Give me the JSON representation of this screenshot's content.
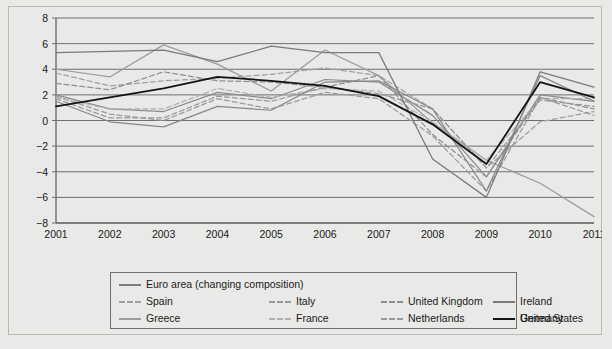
{
  "chart_data": {
    "type": "line",
    "title": "",
    "subtitle": "",
    "xlabel": "",
    "ylabel": "",
    "x": [
      2001,
      2002,
      2003,
      2004,
      2005,
      2006,
      2007,
      2008,
      2009,
      2010,
      2011
    ],
    "xticklabels": [
      "2001",
      "2002",
      "2003",
      "2004",
      "2005",
      "2006",
      "2007",
      "2008",
      "2009",
      "2010",
      "2011"
    ],
    "yticklabels": [
      "8",
      "6",
      "4",
      "2",
      "0",
      "-2",
      "-4",
      "-6",
      "-8"
    ],
    "ylim": [
      -8,
      8
    ],
    "ytick_step": 2,
    "xlim": [
      2001,
      2011
    ],
    "grid": "horizontal",
    "legend_position": "bottom",
    "series": [
      {
        "name": "Euro area (changing composition)",
        "style": "solid",
        "color": "#8a8a8a",
        "values": [
          2.0,
          0.9,
          0.7,
          2.2,
          1.7,
          3.2,
          3.0,
          0.4,
          -4.4,
          2.0,
          1.5
        ]
      },
      {
        "name": "Spain",
        "style": "dashed",
        "color": "#a0a0a0",
        "values": [
          3.7,
          2.7,
          3.1,
          3.3,
          3.6,
          4.1,
          3.5,
          0.9,
          -3.7,
          -0.1,
          0.7
        ]
      },
      {
        "name": "Greece",
        "style": "solid",
        "color": "#9c9c9c",
        "values": [
          4.0,
          3.4,
          5.9,
          4.4,
          2.3,
          5.5,
          3.5,
          -0.2,
          -3.1,
          -4.9,
          -7.5
        ]
      },
      {
        "name": "Italy",
        "style": "dashed",
        "color": "#9a9a9a",
        "values": [
          1.9,
          0.5,
          0.0,
          1.7,
          0.9,
          2.2,
          1.7,
          -1.2,
          -5.5,
          1.8,
          0.4
        ]
      },
      {
        "name": "France",
        "style": "dashed",
        "color": "#b0b0b0",
        "values": [
          1.8,
          0.9,
          0.9,
          2.5,
          1.8,
          2.5,
          2.3,
          -0.1,
          -3.1,
          1.7,
          1.7
        ]
      },
      {
        "name": "United Kingdom",
        "style": "dashed",
        "color": "#8f8f8f",
        "values": [
          2.9,
          2.4,
          3.8,
          3.1,
          3.0,
          2.6,
          3.5,
          -1.1,
          -4.4,
          1.8,
          0.9
        ]
      },
      {
        "name": "Netherlands",
        "style": "dashed",
        "color": "#989898",
        "values": [
          1.7,
          0.2,
          0.2,
          1.9,
          1.5,
          2.6,
          2.1,
          0.9,
          -3.7,
          1.6,
          1.1
        ]
      },
      {
        "name": "Ireland",
        "style": "solid",
        "color": "#7a7a7a",
        "values": [
          5.3,
          5.4,
          5.5,
          4.6,
          5.8,
          5.3,
          5.3,
          -3.0,
          -6.0,
          3.8,
          2.6
        ]
      },
      {
        "name": "Germany",
        "style": "solid",
        "color": "#868686",
        "values": [
          1.5,
          -0.1,
          -0.5,
          1.1,
          0.8,
          3.0,
          3.1,
          0.9,
          -5.5,
          3.5,
          1.5
        ]
      },
      {
        "name": "United States",
        "style": "solid",
        "color": "#141414",
        "values": [
          1.1,
          1.8,
          2.5,
          3.4,
          3.1,
          2.7,
          1.9,
          -0.3,
          -3.4,
          3.0,
          1.8
        ]
      }
    ],
    "legend_rows": [
      [
        {
          "name": "Euro area (changing composition)",
          "style": "solid",
          "color": "#7c7c7c"
        }
      ],
      [
        {
          "name": "Spain",
          "style": "dashed",
          "color": "#a0a0a0"
        },
        {
          "name": "Italy",
          "style": "dashed",
          "color": "#9a9a9a"
        },
        {
          "name": "United Kingdom",
          "style": "dashed",
          "color": "#8f8f8f"
        },
        {
          "name": "Ireland",
          "style": "solid",
          "color": "#7a7a7a"
        }
      ],
      [
        {
          "name": "Greece",
          "style": "solid",
          "color": "#9c9c9c"
        },
        {
          "name": "France",
          "style": "dashed",
          "color": "#b0b0b0"
        },
        {
          "name": "Netherlands",
          "style": "dashed",
          "color": "#989898"
        },
        {
          "name": "Germany",
          "style": "solid",
          "color": "#868686"
        }
      ]
    ],
    "legend_extra_row": [
      {
        "name": "United States",
        "style": "solid",
        "color": "#141414"
      }
    ],
    "colors": {
      "background": "#e9e9e7",
      "plot_background": "#e9e9e7",
      "grid": "#6e6e6e",
      "axis": "#6e6e6e",
      "frame": "#b9b9b5",
      "text": "#1a1a1a"
    }
  }
}
